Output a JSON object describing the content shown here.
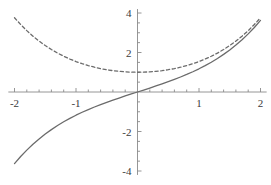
{
  "chart_data": {
    "type": "line",
    "title": "",
    "xlabel": "",
    "ylabel": "",
    "xlim": [
      -2.1,
      2.1
    ],
    "ylim": [
      -4.2,
      4.2
    ],
    "grid": false,
    "legend": "none",
    "axes_style": "crossed-at-origin",
    "x_ticks_major": [
      -2,
      -1,
      1,
      2
    ],
    "x_tick_labels": [
      "-2",
      "-1",
      "1",
      "2"
    ],
    "x_ticks_minor": [
      -1.8,
      -1.6,
      -1.4,
      -1.2,
      -0.8,
      -0.6,
      -0.4,
      -0.2,
      0.2,
      0.4,
      0.6,
      0.8,
      1.2,
      1.4,
      1.6,
      1.8
    ],
    "y_ticks_major": [
      -4,
      -2,
      2,
      4
    ],
    "y_tick_labels": [
      "-4",
      "-2",
      "2",
      "4"
    ],
    "y_ticks_minor": [
      -3.5,
      -3,
      -2.5,
      -1.5,
      -1,
      -0.5,
      0.5,
      1,
      1.5,
      2.5,
      3,
      3.5
    ],
    "x": [
      -2,
      -1.9,
      -1.8,
      -1.7,
      -1.6,
      -1.5,
      -1.4,
      -1.3,
      -1.2,
      -1.1,
      -1,
      -0.9,
      -0.8,
      -0.7,
      -0.6,
      -0.5,
      -0.4,
      -0.3,
      -0.2,
      -0.1,
      0,
      0.1,
      0.2,
      0.3,
      0.4,
      0.5,
      0.6,
      0.7,
      0.8,
      0.9,
      1,
      1.1,
      1.2,
      1.3,
      1.4,
      1.5,
      1.6,
      1.7,
      1.8,
      1.9,
      2
    ],
    "series": [
      {
        "name": "sinh",
        "style": "solid",
        "color": "#6b6b6b",
        "values": [
          -3.627,
          -3.268,
          -2.942,
          -2.646,
          -2.376,
          -2.129,
          -1.904,
          -1.698,
          -1.509,
          -1.336,
          -1.175,
          -1.027,
          -0.888,
          -0.759,
          -0.637,
          -0.521,
          -0.411,
          -0.305,
          -0.201,
          -0.1,
          0,
          0.1,
          0.201,
          0.305,
          0.411,
          0.521,
          0.637,
          0.759,
          0.888,
          1.027,
          1.175,
          1.336,
          1.509,
          1.698,
          1.904,
          2.129,
          2.376,
          2.646,
          2.942,
          3.268,
          3.627
        ]
      },
      {
        "name": "cosh",
        "style": "dashed",
        "color": "#6b6b6b",
        "values": [
          3.762,
          3.418,
          3.107,
          2.828,
          2.577,
          2.352,
          2.151,
          1.971,
          1.811,
          1.669,
          1.543,
          1.433,
          1.337,
          1.255,
          1.185,
          1.128,
          1.081,
          1.045,
          1.02,
          1.005,
          1,
          1.005,
          1.02,
          1.045,
          1.081,
          1.128,
          1.185,
          1.255,
          1.337,
          1.433,
          1.543,
          1.669,
          1.811,
          1.971,
          2.151,
          2.352,
          2.577,
          2.828,
          3.107,
          3.418,
          3.762
        ]
      }
    ],
    "axis_color": "#8a8a8a",
    "label_color": "#3a3a3a",
    "background": "#ffffff"
  }
}
